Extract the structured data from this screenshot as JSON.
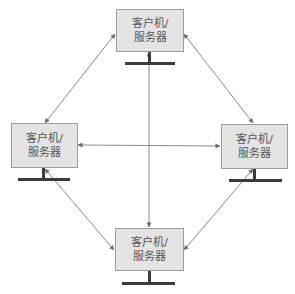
{
  "diagram": {
    "type": "network-topology",
    "colors": {
      "box_fill": "#e4e4e4",
      "box_border": "#9c9c9c",
      "line": "#8a8a8a",
      "stand": "#3c3c3c",
      "text": "#555555"
    },
    "nodes": [
      {
        "id": "top",
        "line1": "客户机/",
        "line2": "服务器"
      },
      {
        "id": "left",
        "line1": "客户机/",
        "line2": "服务器"
      },
      {
        "id": "right",
        "line1": "客户机/",
        "line2": "服务器"
      },
      {
        "id": "bottom",
        "line1": "客户机/",
        "line2": "服务器"
      }
    ],
    "edges": [
      {
        "from": "top",
        "to": "left",
        "bidirectional": true
      },
      {
        "from": "top",
        "to": "right",
        "bidirectional": true
      },
      {
        "from": "top",
        "to": "bottom",
        "bidirectional": true
      },
      {
        "from": "left",
        "to": "right",
        "bidirectional": true
      },
      {
        "from": "left",
        "to": "bottom",
        "bidirectional": true
      },
      {
        "from": "right",
        "to": "bottom",
        "bidirectional": true
      }
    ]
  }
}
